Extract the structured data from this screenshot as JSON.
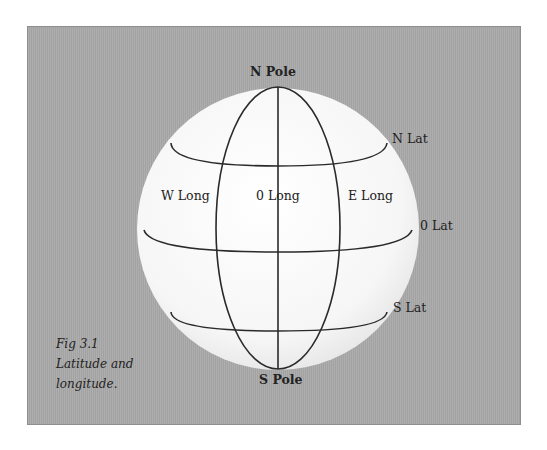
{
  "figure": {
    "caption_lines": [
      "Fig 3.1",
      "Latitude and",
      "longitude."
    ]
  },
  "labels": {
    "n_pole": "N Pole",
    "s_pole": "S Pole",
    "n_lat": "N Lat",
    "zero_lat": "0 Lat",
    "s_lat": "S Lat",
    "w_long": "W Long",
    "zero_long": "0 Long",
    "e_long": "E Long"
  },
  "colors": {
    "background": "#a9a9a9",
    "sphere": "#f4f4f4",
    "lines": "#2a2a2a"
  }
}
